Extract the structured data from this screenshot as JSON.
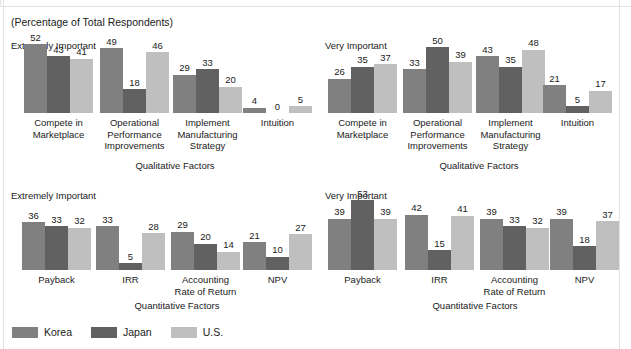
{
  "caption": "(Percentage of Total Respondents)",
  "colors": {
    "korea": "#808080",
    "japan": "#616161",
    "us": "#bfbfbf",
    "text": "#1a1a1a",
    "background": "#ffffff",
    "frame": "#e3e3e3"
  },
  "legend": {
    "items": [
      {
        "label": "Korea",
        "color": "#808080",
        "series": "korea"
      },
      {
        "label": "Japan",
        "color": "#616161",
        "series": "japan"
      },
      {
        "label": "U.S.",
        "color": "#bfbfbf",
        "series": "us"
      }
    ]
  },
  "chart_data": [
    {
      "id": "qualitative-extremely-important",
      "type": "bar",
      "title": "Extremely Important",
      "xlabel": "Qualitative Factors",
      "ylabel": "",
      "ylim": [
        0,
        55
      ],
      "grid": false,
      "legend_position": "bottom",
      "categories": [
        "Compete in\nMarketplace",
        "Operational\nPerformance\nImprovements",
        "Implement\nManufacturing\nStrategy",
        "Intuition"
      ],
      "series": [
        {
          "name": "Korea",
          "values": [
            52,
            49,
            29,
            4
          ]
        },
        {
          "name": "Japan",
          "values": [
            43,
            18,
            33,
            0
          ]
        },
        {
          "name": "U.S.",
          "values": [
            41,
            46,
            20,
            5
          ]
        }
      ]
    },
    {
      "id": "qualitative-very-important",
      "type": "bar",
      "title": "Very Important",
      "xlabel": "Qualitative Factors",
      "ylabel": "",
      "ylim": [
        0,
        55
      ],
      "grid": false,
      "legend_position": "bottom",
      "categories": [
        "Compete in\nMarketplace",
        "Operational\nPerformance\nImprovements",
        "Implement\nManufacturing\nStrategy",
        "Intuition"
      ],
      "series": [
        {
          "name": "Korea",
          "values": [
            26,
            33,
            43,
            21
          ]
        },
        {
          "name": "Japan",
          "values": [
            35,
            50,
            35,
            5
          ]
        },
        {
          "name": "U.S.",
          "values": [
            37,
            39,
            48,
            17
          ]
        }
      ]
    },
    {
      "id": "quantitative-extremely-important",
      "type": "bar",
      "title": "Extremely Important",
      "xlabel": "Quantitative Factors",
      "ylabel": "",
      "ylim": [
        0,
        55
      ],
      "grid": false,
      "legend_position": "bottom",
      "categories": [
        "Payback",
        "IRR",
        "Accounting\nRate of Return",
        "NPV"
      ],
      "series": [
        {
          "name": "Korea",
          "values": [
            36,
            33,
            29,
            21
          ]
        },
        {
          "name": "Japan",
          "values": [
            33,
            5,
            20,
            10
          ]
        },
        {
          "name": "U.S.",
          "values": [
            32,
            28,
            14,
            27
          ]
        }
      ]
    },
    {
      "id": "quantitative-very-important",
      "type": "bar",
      "title": "Very Important",
      "xlabel": "Quantitative Factors",
      "ylabel": "",
      "ylim": [
        0,
        55
      ],
      "grid": false,
      "legend_position": "bottom",
      "categories": [
        "Payback",
        "IRR",
        "Accounting\nRate of Return",
        "NPV"
      ],
      "series": [
        {
          "name": "Korea",
          "values": [
            39,
            42,
            39,
            39
          ]
        },
        {
          "name": "Japan",
          "values": [
            53,
            15,
            33,
            18
          ]
        },
        {
          "name": "U.S.",
          "values": [
            39,
            41,
            32,
            37
          ]
        }
      ]
    }
  ]
}
